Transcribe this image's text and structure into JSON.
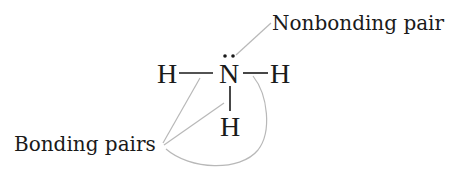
{
  "diagram": {
    "molecule": "NH3",
    "atoms": {
      "central": "N",
      "left": "H",
      "right": "H",
      "bottom": "H"
    },
    "lone_pair_dots": "..",
    "labels": {
      "nonbonding": "Nonbonding pair",
      "bonding": "Bonding pairs"
    },
    "colors": {
      "text": "#1a1a1a",
      "leader_lines": "#b8b8b8",
      "background": "#ffffff"
    }
  }
}
